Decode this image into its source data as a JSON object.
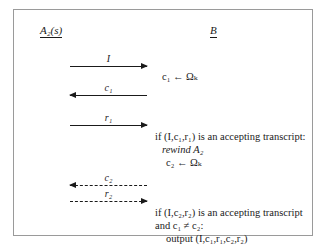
{
  "figure": {
    "type": "protocol-message-sequence-diagram",
    "participants": {
      "left": "A₂(s)",
      "right": "B"
    },
    "messages": [
      {
        "id": "I",
        "label": "I",
        "direction": "right",
        "style": "solid"
      },
      {
        "id": "c1",
        "label": "c₁",
        "direction": "left",
        "style": "solid"
      },
      {
        "id": "r1",
        "label": "r₁",
        "direction": "right",
        "style": "solid"
      },
      {
        "id": "c2",
        "label": "c₂",
        "direction": "left",
        "style": "dashed"
      },
      {
        "id": "r2",
        "label": "r₂",
        "direction": "right",
        "style": "dashed"
      }
    ],
    "notes": {
      "assign_c1": "c₁ ← Ωₖ",
      "block1": {
        "line1": "if (I,c₁,r₁) is an accepting transcript:",
        "line2": "rewind A₂",
        "line3": "c₂ ← Ωₖ"
      },
      "block2": {
        "line1": "if (I,c₂,r₂) is an accepting transcript",
        "line2": "and c₁ ≠ c₂:",
        "line3": "output (I,c₁,r₁,c₂,r₂)"
      }
    },
    "colors": {
      "ink": "#1a1a1a",
      "border": "#9a9a9a",
      "background": "#ffffff"
    }
  }
}
